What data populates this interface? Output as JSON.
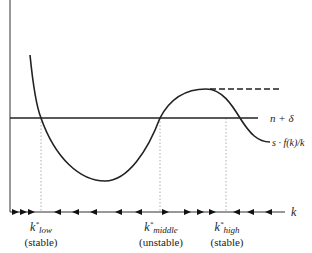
{
  "diagram": {
    "curves": [
      {
        "name": "n + δ",
        "label": "n + δ",
        "style": "solid horizontal line"
      },
      {
        "name": "s · f(k)/k",
        "label": "s · f(k)/k",
        "style": "solid S-shaped curve"
      },
      {
        "name": "upper dashed",
        "style": "dashed horizontal line at local maximum"
      }
    ],
    "axes": {
      "x_label": "k",
      "y_label": ""
    },
    "labels": {
      "line_label": "n + δ",
      "curve_label": "s · f(k)/k",
      "x_axis": "k"
    },
    "steady_states": [
      {
        "symbol": "k*",
        "subscript": "low",
        "status": "(stable)"
      },
      {
        "symbol": "k*",
        "subscript": "middle",
        "status": "(unstable)"
      },
      {
        "symbol": "k*",
        "subscript": "high",
        "status": "(stable)"
      }
    ],
    "phase_arrows": {
      "left_of_low": "right",
      "low_to_middle": "left",
      "middle_to_high": "right",
      "right_of_high": "left"
    }
  }
}
